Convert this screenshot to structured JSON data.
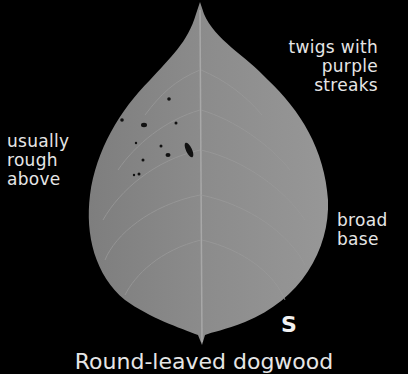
{
  "image": {
    "subject": "leaf photograph on black background",
    "colors": {
      "background": "#000000",
      "leaf": "#8a8a8a",
      "text": "#e6e6e6"
    }
  },
  "annotations": {
    "top_right": [
      "twigs with",
      "purple",
      "streaks"
    ],
    "left": [
      "usually",
      "rough",
      "above"
    ],
    "right": [
      "broad",
      "base"
    ],
    "marker": "S"
  },
  "caption": "Round-leaved dogwood"
}
